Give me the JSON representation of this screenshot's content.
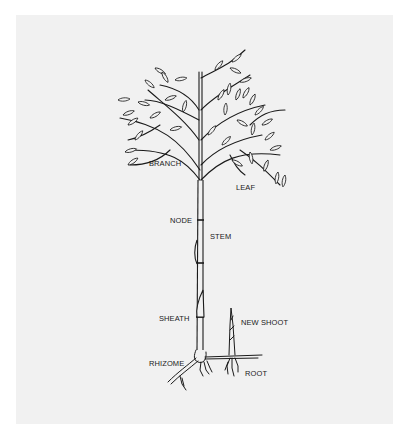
{
  "diagram": {
    "background_color": "#f1f1f1",
    "line_color": "#1a1a1a",
    "labels": {
      "branch": "BRANCH",
      "leaf": "LEAF",
      "node": "NODE",
      "stem": "STEM",
      "sheath": "SHEATH",
      "new_shoot": "NEW SHOOT",
      "rhizome": "RHIZOME",
      "root": "ROOT"
    }
  }
}
